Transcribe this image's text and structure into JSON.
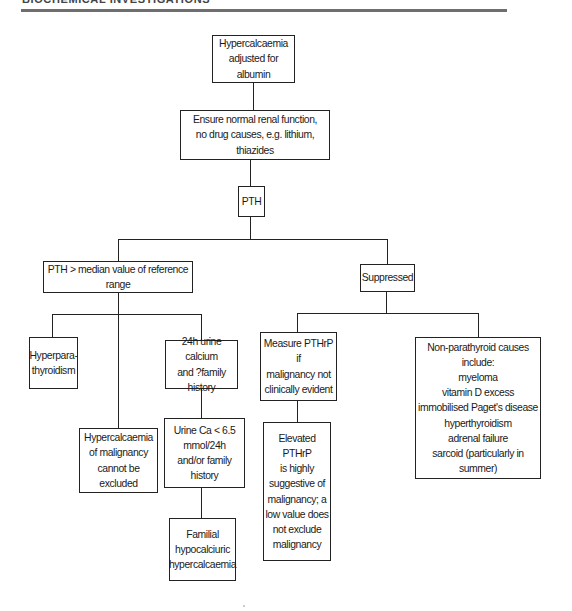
{
  "header": {
    "running_title": "BIOCHEMICAL INVESTIGATIONS"
  },
  "flowchart": {
    "title_node": "Hypercalcaemia\nadjusted for albumin",
    "check_node": "Ensure normal renal function,\nno drug causes, e.g. lithium, thiazides",
    "pth_node": "PTH",
    "branches": {
      "high": {
        "label": "PTH > median value of reference range",
        "hyperpara": "Hyperpara-\nthyroidism",
        "malignancy": "Hypercalcaemia\nof malignancy\ncannot be excluded",
        "urine_test": "24h urine calcium\nand ?family history",
        "urine_result": "Urine Ca < 6.5\nmmol/24h\nand/or family history",
        "fhh": "Familial\nhypocalciuric\nhypercalcaemia"
      },
      "suppressed": {
        "label": "Suppressed",
        "pthrp_measure": "Measure PTHrP if\nmalignancy not\nclinically evident",
        "pthrp_result": "Elevated PTHrP\nis highly\nsuggestive of\nmalignancy; a\nlow value does\nnot exclude\nmalignancy",
        "non_parathyroid": {
          "heading": "Non-parathyroid causes\ninclude:",
          "causes": [
            "myeloma",
            "vitamin D excess",
            "immobilised Paget's disease",
            "hyperthyroidism",
            "adrenal failure",
            "sarcoid (particularly in summer)"
          ]
        }
      }
    }
  }
}
